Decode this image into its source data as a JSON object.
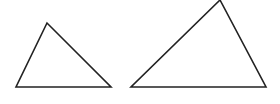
{
  "diagram": {
    "background": "#ffffff",
    "stroke_color": "#222222",
    "stroke_width": 1.6,
    "shapes": [
      {
        "name": "small-triangle",
        "type": "triangle",
        "points": [
          [
            47,
            23
          ],
          [
            16,
            87
          ],
          [
            111,
            87
          ]
        ]
      },
      {
        "name": "large-triangle",
        "type": "triangle",
        "points": [
          [
            220,
            0
          ],
          [
            131,
            87
          ],
          [
            266,
            87
          ]
        ]
      }
    ]
  }
}
